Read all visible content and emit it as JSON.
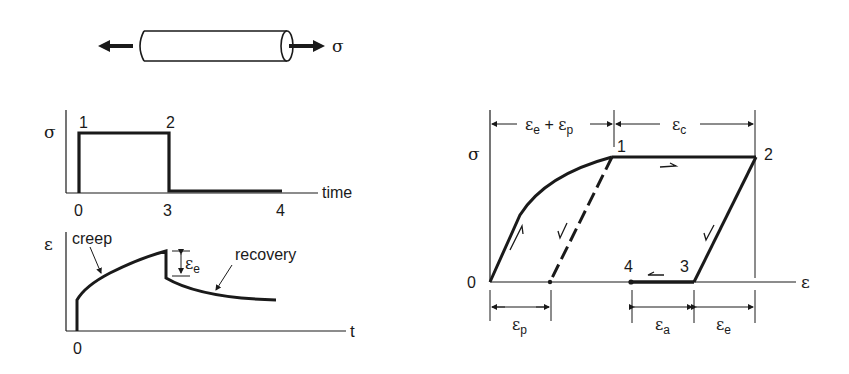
{
  "specimen": {
    "stress_label": "σ"
  },
  "stress_time_plot": {
    "y_label": "σ",
    "x_label": "time",
    "points": {
      "p1": "1",
      "p2": "2"
    },
    "x_ticks": {
      "t0": "0",
      "t3": "3",
      "t4": "4"
    }
  },
  "strain_time_plot": {
    "y_label": "ε",
    "x_label": "t",
    "x_tick": "0",
    "creep_label": "creep",
    "recovery_label": "recovery",
    "elastic_label": "ε",
    "elastic_sub": "e"
  },
  "stress_strain_plot": {
    "y_label": "σ",
    "x_label": "ε",
    "origin": "0",
    "points": {
      "p1": "1",
      "p2": "2",
      "p3": "3",
      "p4": "4"
    },
    "top_dims": {
      "left": {
        "sym": "ε",
        "sub1": "e",
        "plus": " + ",
        "sym2": "ε",
        "sub2": "p"
      },
      "right": {
        "sym": "ε",
        "sub": "c"
      }
    },
    "bottom_dims": {
      "plastic": {
        "sym": "ε",
        "sub": "p"
      },
      "anelastic": {
        "sym": "ε",
        "sub": "a"
      },
      "elastic": {
        "sym": "ε",
        "sub": "e"
      }
    }
  }
}
